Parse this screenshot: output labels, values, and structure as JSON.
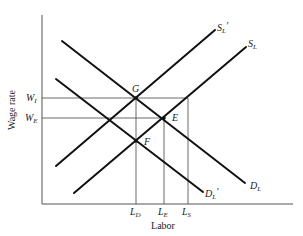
{
  "diagram": {
    "type": "labor-market-supply-demand",
    "x_axis_label": "Labor",
    "y_axis_label": "Wage rate",
    "curves": [
      {
        "id": "DL",
        "main": "D",
        "sub": "L",
        "prime": ""
      },
      {
        "id": "DLp",
        "main": "D",
        "sub": "L",
        "prime": "′"
      },
      {
        "id": "SL",
        "main": "S",
        "sub": "L",
        "prime": ""
      },
      {
        "id": "SLp",
        "main": "S",
        "sub": "L",
        "prime": "′"
      }
    ],
    "points": [
      {
        "id": "G",
        "label": "G"
      },
      {
        "id": "E",
        "label": "E"
      },
      {
        "id": "F",
        "label": "F"
      }
    ],
    "y_ticks": [
      {
        "id": "WI",
        "main": "W",
        "sub": "I"
      },
      {
        "id": "WE",
        "main": "W",
        "sub": "E"
      }
    ],
    "x_ticks": [
      {
        "id": "LD",
        "main": "L",
        "sub": "D"
      },
      {
        "id": "LE",
        "main": "L",
        "sub": "E"
      },
      {
        "id": "LS",
        "main": "L",
        "sub": "S"
      }
    ]
  }
}
